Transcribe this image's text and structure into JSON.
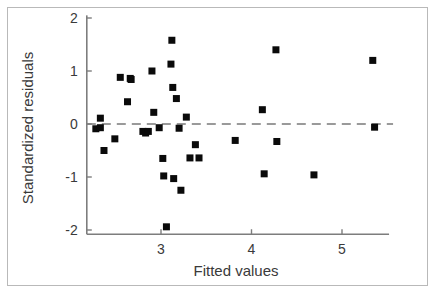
{
  "chart_data": {
    "type": "scatter",
    "title": "",
    "xlabel": "Fitted values",
    "ylabel": "Standardized residuals",
    "xlim": [
      2.18,
      5.52
    ],
    "ylim": [
      -2.08,
      2.05
    ],
    "xticks": [
      3,
      4,
      5
    ],
    "xtick_labels": [
      "3",
      "4",
      "5"
    ],
    "yticks": [
      2,
      1,
      0,
      -1,
      -2
    ],
    "ytick_labels": [
      "2",
      "1",
      "0",
      "-1",
      "-2"
    ],
    "grid": false,
    "legend": null,
    "reference_line": {
      "orientation": "horizontal",
      "value": 0,
      "style": "dashed",
      "color": "#9a9a9a"
    },
    "marker": {
      "shape": "square",
      "color": "#0a0a0a",
      "size": 7
    },
    "x": [
      2.28,
      2.33,
      2.33,
      2.37,
      2.49,
      2.55,
      2.63,
      2.66,
      2.67,
      2.8,
      2.83,
      2.86,
      2.9,
      2.92,
      2.98,
      3.02,
      3.03,
      3.06,
      3.11,
      3.12,
      3.13,
      3.14,
      3.17,
      3.2,
      3.22,
      3.28,
      3.32,
      3.38,
      3.42,
      3.82,
      4.12,
      4.14,
      4.27,
      4.28,
      4.69,
      5.34,
      5.36
    ],
    "y": [
      -0.09,
      0.11,
      -0.07,
      -0.5,
      -0.28,
      0.88,
      0.42,
      0.86,
      0.84,
      -0.14,
      -0.17,
      -0.14,
      1.0,
      0.22,
      -0.07,
      -0.65,
      -0.98,
      -1.94,
      1.13,
      1.58,
      0.69,
      -1.03,
      0.48,
      -0.08,
      -1.25,
      0.13,
      -0.64,
      -0.39,
      -0.64,
      -0.31,
      0.27,
      -0.94,
      1.4,
      -0.33,
      -0.96,
      1.2,
      -0.06
    ],
    "points": [
      {
        "x": 2.28,
        "y": -0.09
      },
      {
        "x": 2.33,
        "y": 0.11
      },
      {
        "x": 2.33,
        "y": -0.07
      },
      {
        "x": 2.37,
        "y": -0.5
      },
      {
        "x": 2.49,
        "y": -0.28
      },
      {
        "x": 2.55,
        "y": 0.88
      },
      {
        "x": 2.63,
        "y": 0.42
      },
      {
        "x": 2.66,
        "y": 0.86
      },
      {
        "x": 2.67,
        "y": 0.84
      },
      {
        "x": 2.8,
        "y": -0.14
      },
      {
        "x": 2.83,
        "y": -0.17
      },
      {
        "x": 2.86,
        "y": -0.14
      },
      {
        "x": 2.9,
        "y": 1.0
      },
      {
        "x": 2.92,
        "y": 0.22
      },
      {
        "x": 2.98,
        "y": -0.07
      },
      {
        "x": 3.02,
        "y": -0.65
      },
      {
        "x": 3.03,
        "y": -0.98
      },
      {
        "x": 3.06,
        "y": -1.94
      },
      {
        "x": 3.11,
        "y": 1.13
      },
      {
        "x": 3.12,
        "y": 1.58
      },
      {
        "x": 3.13,
        "y": 0.69
      },
      {
        "x": 3.14,
        "y": -1.03
      },
      {
        "x": 3.17,
        "y": 0.48
      },
      {
        "x": 3.2,
        "y": -0.08
      },
      {
        "x": 3.22,
        "y": -1.25
      },
      {
        "x": 3.28,
        "y": 0.13
      },
      {
        "x": 3.32,
        "y": -0.64
      },
      {
        "x": 3.38,
        "y": -0.39
      },
      {
        "x": 3.42,
        "y": -0.64
      },
      {
        "x": 3.82,
        "y": -0.31
      },
      {
        "x": 4.12,
        "y": 0.27
      },
      {
        "x": 4.14,
        "y": -0.94
      },
      {
        "x": 4.27,
        "y": 1.4
      },
      {
        "x": 4.28,
        "y": -0.33
      },
      {
        "x": 4.69,
        "y": -0.96
      },
      {
        "x": 5.34,
        "y": 1.2
      },
      {
        "x": 5.36,
        "y": -0.06
      }
    ]
  }
}
